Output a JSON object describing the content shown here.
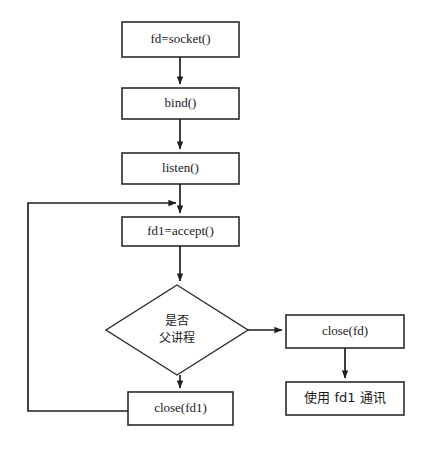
{
  "diagram": {
    "background_color": "#ffffff",
    "stroke_color": "#2b2b2b",
    "text_color": "#1a1a1a",
    "nodes": [
      {
        "id": "socket",
        "shape": "process",
        "label": "fd=socket()"
      },
      {
        "id": "bind",
        "shape": "process",
        "label": "bind()"
      },
      {
        "id": "listen",
        "shape": "process",
        "label": "listen()"
      },
      {
        "id": "accept",
        "shape": "process",
        "label": "fd1=accept()"
      },
      {
        "id": "decision",
        "shape": "decision",
        "label": "是否\n父讲程",
        "line1": "是否",
        "line2": "父讲程"
      },
      {
        "id": "closefd",
        "shape": "process",
        "label": "close(fd)"
      },
      {
        "id": "usefd1",
        "shape": "process",
        "label": "使用 fd1 通讯"
      },
      {
        "id": "closefd1",
        "shape": "process",
        "label": "close(fd1)"
      }
    ],
    "edges": [
      {
        "from": "socket",
        "to": "bind",
        "label": ""
      },
      {
        "from": "bind",
        "to": "listen",
        "label": ""
      },
      {
        "from": "listen",
        "to": "accept",
        "label": ""
      },
      {
        "from": "accept",
        "to": "decision",
        "label": ""
      },
      {
        "from": "decision",
        "to": "closefd",
        "label": ""
      },
      {
        "from": "decision",
        "to": "closefd1",
        "label": ""
      },
      {
        "from": "closefd",
        "to": "usefd1",
        "label": ""
      },
      {
        "from": "closefd1",
        "to": "accept",
        "label": ""
      }
    ]
  }
}
